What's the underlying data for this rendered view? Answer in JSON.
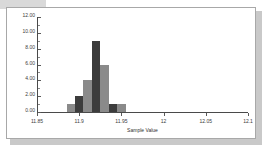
{
  "chart_data": {
    "type": "bar",
    "title": "",
    "subtitle": "",
    "xlabel": "Sample Value",
    "ylabel": "",
    "grid": false,
    "legend": "none",
    "xlim": [
      11.85,
      12.1
    ],
    "ylim": [
      0,
      12
    ],
    "x_tick_labels": [
      "11.85",
      "11.9",
      "11.95",
      "12",
      "12.05",
      "12.1"
    ],
    "x_tick_values": [
      11.85,
      11.9,
      11.95,
      12,
      12.05,
      12.1
    ],
    "y_tick_labels": [
      "0.00",
      "2.00",
      "4.00",
      "6.00",
      "8.00",
      "10.00",
      "12.00"
    ],
    "y_tick_values": [
      0,
      2,
      4,
      6,
      8,
      10,
      12
    ],
    "bin_width": 0.01,
    "bin_starts": [
      11.885,
      11.895,
      11.905,
      11.915,
      11.925,
      11.935,
      11.945
    ],
    "categories": [
      "11.885-11.895",
      "11.895-11.905",
      "11.905-11.915",
      "11.915-11.925",
      "11.925-11.935",
      "11.935-11.945",
      "11.945-11.955"
    ],
    "values": [
      1,
      2,
      4,
      9,
      6,
      1,
      1
    ],
    "bar_colors": [
      "#8a8a8a",
      "#3c3c3c",
      "#8a8a8a",
      "#3c3c3c",
      "#8a8a8a",
      "#3c3c3c",
      "#8a8a8a"
    ]
  },
  "axes": {
    "x_axis_title": "Sample Value"
  },
  "colors": {
    "frame_border": "#a8a8a8",
    "shadow": "#c9c9c9",
    "axis": "#4a4a4a",
    "tick_text": "#3b3b3b",
    "bar_light": "#8a8a8a",
    "bar_dark": "#3c3c3c",
    "plot_background": "#ffffff"
  }
}
